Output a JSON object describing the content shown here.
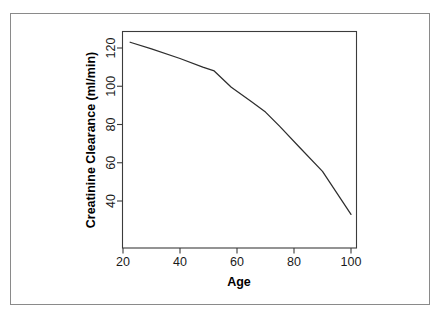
{
  "chart_data": {
    "type": "line",
    "title": "",
    "xlabel": "Age",
    "ylabel": "Creatinine Clearance (ml/min)",
    "xlim": [
      20,
      102
    ],
    "ylim": [
      30,
      126
    ],
    "xticks": [
      20,
      40,
      60,
      80,
      100
    ],
    "yticks": [
      40,
      60,
      80,
      100,
      120
    ],
    "xtick_labels": [
      "20",
      "40",
      "60",
      "80",
      "100"
    ],
    "ytick_labels": [
      "40",
      "60",
      "80",
      "100",
      "120"
    ],
    "grid": false,
    "legend": false,
    "series": [
      {
        "name": "Creatinine Clearance",
        "color": "#2e2e2e",
        "x": [
          22.5,
          30,
          40,
          48,
          52,
          58,
          65,
          70,
          75,
          82,
          90,
          100
        ],
        "y": [
          123,
          119.5,
          114.5,
          110,
          108,
          99.5,
          92,
          86.5,
          79,
          68,
          55.5,
          33
        ]
      }
    ]
  },
  "axes": {
    "x_label": "Age",
    "y_label": "Creatinine Clearance (ml/min)"
  },
  "colors": {
    "line": "#2e2e2e",
    "axis": "#3b3b3b",
    "outer_border": "#8a8a8a",
    "background": "#ffffff"
  }
}
